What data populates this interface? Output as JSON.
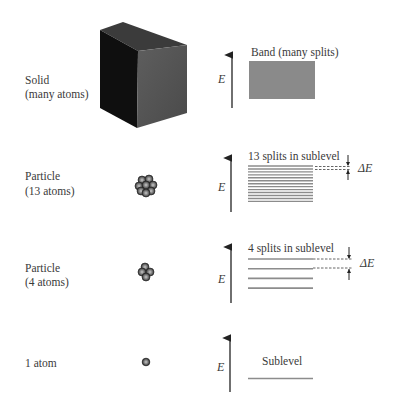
{
  "figure": {
    "rows": [
      {
        "id": "solid",
        "label_line1": "Solid",
        "label_line2": "(many atoms)",
        "level_label": "Band (many splits)",
        "energy_axis_label": "E"
      },
      {
        "id": "particle-13",
        "label_line1": "Particle",
        "label_line2": "(13 atoms)",
        "level_label": "13 splits in sublevel",
        "energy_axis_label": "E",
        "spacing_label": "ΔE",
        "line_count": 13
      },
      {
        "id": "particle-4",
        "label_line1": "Particle",
        "label_line2": "(4 atoms)",
        "level_label": "4 splits in sublevel",
        "energy_axis_label": "E",
        "spacing_label": "ΔE",
        "line_count": 4
      },
      {
        "id": "single-atom",
        "label_line1": "1 atom",
        "level_label": "Sublevel",
        "energy_axis_label": "E",
        "line_count": 1
      }
    ],
    "colors": {
      "text": "#3a3a3a",
      "band_fill": "#8a8a8a",
      "level_line": "#8c8c8c",
      "arrow": "#222222",
      "cube_front": "#111111",
      "cube_side": "#5a5a5a",
      "cube_top": "#3a3a3a",
      "atom": "#6e6e6e"
    }
  }
}
